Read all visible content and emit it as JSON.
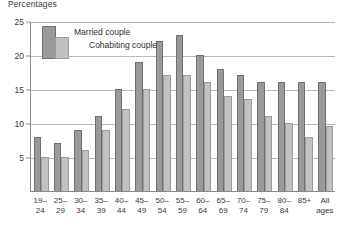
{
  "chart_data": {
    "type": "bar",
    "title": "Percentages",
    "xlabel": "",
    "ylabel": "",
    "ylim": [
      0,
      25
    ],
    "yticks": [
      0,
      5,
      10,
      15,
      20,
      25
    ],
    "ytick_labels": [
      "",
      "5",
      "10",
      "15",
      "20",
      "25"
    ],
    "grid": true,
    "legend_position": "top-left",
    "categories": [
      "19–\n24",
      "25–\n29",
      "30–\n34",
      "35–\n39",
      "40–\n44",
      "45–\n49",
      "50–\n54",
      "55–\n59",
      "60–\n64",
      "65–\n69",
      "70–\n74",
      "75–\n79",
      "80–\n84",
      "85+",
      "All\nages"
    ],
    "series": [
      {
        "name": "Married couple",
        "color": "#9a9a9a",
        "values": [
          8,
          7,
          9,
          11,
          15,
          19,
          22,
          23,
          20,
          18,
          17,
          16,
          16,
          16,
          16
        ]
      },
      {
        "name": "Cohabiting couple",
        "color": "#c2c2c2",
        "values": [
          5,
          5,
          6,
          9,
          12,
          15,
          17,
          17,
          16,
          14,
          13.5,
          11,
          10,
          8,
          9.5
        ]
      }
    ]
  },
  "legend": {
    "married_label": "Married couple",
    "cohabiting_label": "Cohabiting couple"
  }
}
